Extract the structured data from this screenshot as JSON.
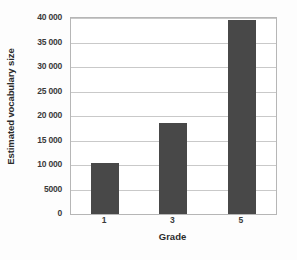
{
  "chart_data": {
    "type": "bar",
    "title": "",
    "categories": [
      "1",
      "3",
      "5"
    ],
    "values": [
      10500,
      18500,
      39500
    ],
    "xlabel": "Grade",
    "ylabel": "Estimated vocabulary size",
    "ylim": [
      0,
      40000
    ],
    "ytick_values": [
      0,
      5000,
      10000,
      15000,
      20000,
      25000,
      30000,
      35000,
      40000
    ],
    "ytick_labels": [
      "0",
      "5000",
      "10 000",
      "15 000",
      "20 000",
      "25 000",
      "30 000",
      "35 000",
      "40 000"
    ],
    "grid": true,
    "legend": "none",
    "bar_color": "#484848",
    "gridline_color": "#c9c9c9",
    "axis_color": "#b6b6b6",
    "background_color": "#fdfdfd"
  }
}
